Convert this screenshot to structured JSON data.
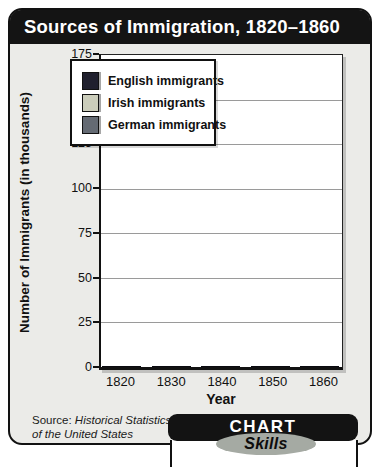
{
  "title": "Sources of Immigration, 1820–1860",
  "chart_data": {
    "type": "bar",
    "title": "Sources of Immigration, 1820–1860",
    "categories": [
      "1820",
      "1830",
      "1840",
      "1850",
      "1860"
    ],
    "series": [
      {
        "name": "English immigrants",
        "color": "#20202e",
        "values": [
          2,
          2,
          3,
          51,
          29
        ]
      },
      {
        "name": "Irish immigrants",
        "color": "#cbcdbb",
        "values": [
          4,
          3,
          39,
          165,
          49
        ]
      },
      {
        "name": "German immigrants",
        "color": "#646a73",
        "values": [
          1,
          2,
          30,
          79,
          54
        ]
      }
    ],
    "xlabel": "Year",
    "ylabel": "Number of Immigrants (in thousands)",
    "ylim": [
      0,
      175
    ],
    "yticks": [
      0,
      25,
      50,
      75,
      100,
      125,
      150,
      175
    ],
    "grid": true,
    "legend_position": "top-left"
  },
  "source": {
    "prefix": "Source: ",
    "line1": "Historical Statistics",
    "line2": "of the United States"
  },
  "badge": {
    "chart_label": "CHART",
    "skills_label": "Skills"
  },
  "colors": {
    "card_background": "#ebebe8",
    "title_bar": "#141414",
    "plot_background": "#ffffff",
    "gridline": "#9a9a9a",
    "skills_ellipse": "#a5aaa3"
  }
}
